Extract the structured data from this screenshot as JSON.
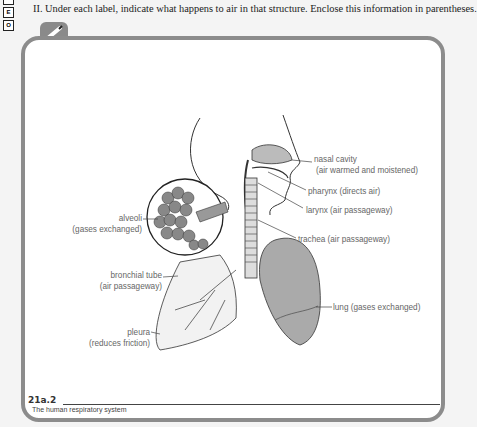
{
  "side_tabs": [
    "",
    "E",
    "O"
  ],
  "instruction": "II. Under each label, indicate what happens to air in that structure. Enclose this information in parentheses.",
  "figure": {
    "number": "21a.2",
    "caption": "The human respiratory system",
    "labels": {
      "nasal_cavity": {
        "name": "nasal cavity",
        "note": "(air warmed and moistened)"
      },
      "pharynx": {
        "name": "pharynx (directs air)"
      },
      "larynx": {
        "name": "larynx (air passageway)"
      },
      "trachea": {
        "name": "trachea (air passageway)"
      },
      "alveoli": {
        "name": "alveoli",
        "note": "(gases exchanged)"
      },
      "bronchial_tube": {
        "name": "bronchial tube",
        "note": "(air passageway)"
      },
      "lung": {
        "name": "lung (gases exchanged)"
      },
      "pleura": {
        "name": "pleura",
        "note": "(reduces friction)"
      }
    }
  },
  "colors": {
    "frame": "#8c8c8c",
    "label": "#666666",
    "background": "#f4f4f4"
  }
}
